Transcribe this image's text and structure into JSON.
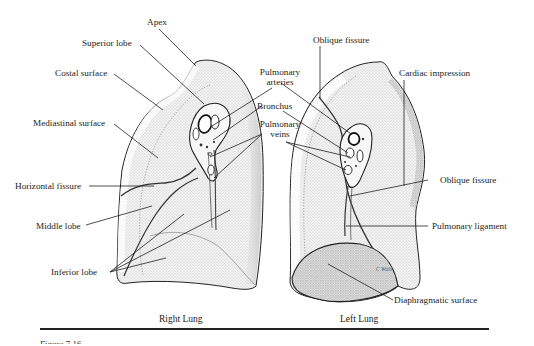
{
  "figure": {
    "number_partial": "Figure 7.16",
    "panels": [
      {
        "id": "right-lung",
        "caption": "Right Lung"
      },
      {
        "id": "left-lung",
        "caption": "Left Lung"
      }
    ]
  },
  "labels": {
    "apex": "Apex",
    "superior_lobe": "Superior lobe",
    "costal_surface": "Costal surface",
    "mediastinal_surface": "Mediastinal surface",
    "horizontal_fissure": "Horizontal fissure",
    "middle_lobe": "Middle lobe",
    "inferior_lobe": "Inferior lobe",
    "pulmonary_arteries_1": "Pulmonary",
    "pulmonary_arteries_2": "arteries",
    "bronchus": "Bronchus",
    "pulmonary_veins_1": "Pulmonary",
    "pulmonary_veins_2": "veins",
    "oblique_fissure_top": "Oblique fissure",
    "cardiac_impression": "Cardiac impression",
    "oblique_fissure_right": "Oblique fissure",
    "pulmonary_ligament": "Pulmonary ligament",
    "diaphragmatic_surface": "Diaphragmatic surface",
    "signature": "C Wuhl"
  },
  "colors": {
    "ink": "#1c1c1c",
    "stipple_light": "#e6e6e6",
    "stipple_mid": "#d2d2d2",
    "stipple_dark": "#bdbdbd",
    "paper": "#ffffff"
  }
}
